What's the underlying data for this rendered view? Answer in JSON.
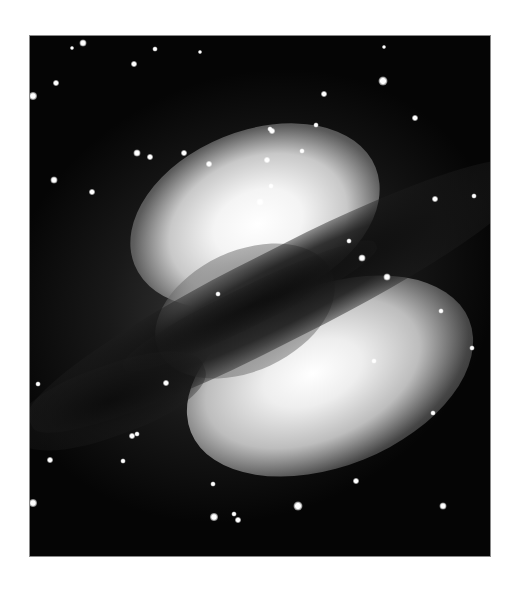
{
  "image": {
    "subject": "elliptical galaxy with dark dust lane (grayscale astronomical photograph)",
    "background_color": "#ffffff",
    "sky_color": "#050505",
    "frame": {
      "left": 29,
      "top": 35,
      "width": 462,
      "height": 522
    }
  },
  "stars": [
    {
      "x": 53,
      "y": 7,
      "r": 7
    },
    {
      "x": 42,
      "y": 12,
      "r": 4
    },
    {
      "x": 125,
      "y": 13,
      "r": 5
    },
    {
      "x": 170,
      "y": 16,
      "r": 4
    },
    {
      "x": 104,
      "y": 28,
      "r": 6
    },
    {
      "x": 26,
      "y": 47,
      "r": 6
    },
    {
      "x": 3,
      "y": 60,
      "r": 8
    },
    {
      "x": 354,
      "y": 11,
      "r": 4
    },
    {
      "x": 353,
      "y": 45,
      "r": 9
    },
    {
      "x": 294,
      "y": 58,
      "r": 6
    },
    {
      "x": 286,
      "y": 89,
      "r": 5
    },
    {
      "x": 385,
      "y": 82,
      "r": 6
    },
    {
      "x": 242,
      "y": 95,
      "r": 6
    },
    {
      "x": 237,
      "y": 124,
      "r": 6
    },
    {
      "x": 107,
      "y": 117,
      "r": 7
    },
    {
      "x": 120,
      "y": 121,
      "r": 6
    },
    {
      "x": 154,
      "y": 117,
      "r": 6
    },
    {
      "x": 179,
      "y": 128,
      "r": 6
    },
    {
      "x": 24,
      "y": 144,
      "r": 7
    },
    {
      "x": 62,
      "y": 156,
      "r": 6
    },
    {
      "x": 240,
      "y": 93,
      "r": 5
    },
    {
      "x": 272,
      "y": 115,
      "r": 5
    },
    {
      "x": 241,
      "y": 150,
      "r": 5
    },
    {
      "x": 405,
      "y": 163,
      "r": 6
    },
    {
      "x": 444,
      "y": 160,
      "r": 5
    },
    {
      "x": 230,
      "y": 166,
      "r": 7
    },
    {
      "x": 332,
      "y": 222,
      "r": 7
    },
    {
      "x": 319,
      "y": 205,
      "r": 5
    },
    {
      "x": 188,
      "y": 258,
      "r": 5
    },
    {
      "x": 8,
      "y": 348,
      "r": 5
    },
    {
      "x": 136,
      "y": 347,
      "r": 6
    },
    {
      "x": 102,
      "y": 400,
      "r": 6
    },
    {
      "x": 20,
      "y": 424,
      "r": 6
    },
    {
      "x": 93,
      "y": 425,
      "r": 5
    },
    {
      "x": 3,
      "y": 467,
      "r": 8
    },
    {
      "x": 184,
      "y": 481,
      "r": 8
    },
    {
      "x": 208,
      "y": 484,
      "r": 6
    },
    {
      "x": 268,
      "y": 470,
      "r": 9
    },
    {
      "x": 183,
      "y": 448,
      "r": 5
    },
    {
      "x": 413,
      "y": 470,
      "r": 7
    },
    {
      "x": 403,
      "y": 377,
      "r": 5
    },
    {
      "x": 442,
      "y": 312,
      "r": 5
    },
    {
      "x": 411,
      "y": 275,
      "r": 5
    },
    {
      "x": 357,
      "y": 241,
      "r": 7
    },
    {
      "x": 204,
      "y": 478,
      "r": 5
    },
    {
      "x": 291,
      "y": 523,
      "r": 5
    },
    {
      "x": 107,
      "y": 398,
      "r": 5
    },
    {
      "x": 344,
      "y": 325,
      "r": 5
    },
    {
      "x": 326,
      "y": 445,
      "r": 6
    }
  ]
}
